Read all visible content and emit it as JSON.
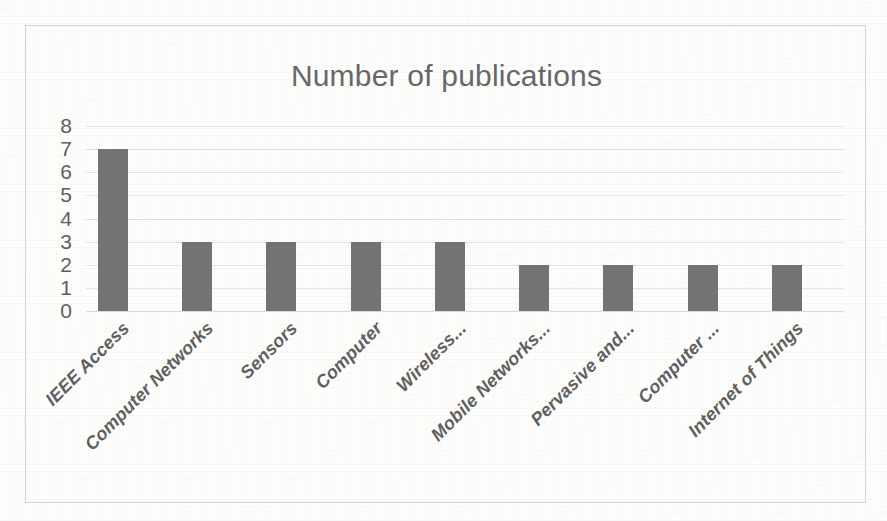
{
  "chart_data": {
    "type": "bar",
    "title": "Number of publications",
    "xlabel": "",
    "ylabel": "",
    "ylim": [
      0,
      8
    ],
    "yticks": [
      8,
      7,
      6,
      5,
      4,
      3,
      2,
      1,
      0
    ],
    "grid": true,
    "legend": null,
    "orientation": "vertical",
    "bar_color": "#737373",
    "categories": [
      "IEEE Access",
      "Computer Networks",
      "Sensors",
      "Computer",
      "Wireless...",
      "Mobile Networks...",
      "Pervasive and...",
      "Computer ...",
      "Internet of Things"
    ],
    "values": [
      7,
      3,
      3,
      3,
      3,
      2,
      2,
      2,
      2
    ]
  },
  "figure": {
    "border_color": "#d2d2d4",
    "background": "#fdfdfc",
    "gridline_color": "#e4e4e6",
    "title_color": "#676767",
    "tick_color": "#5e5e5e",
    "xlabel_color": "#5f5f5f"
  }
}
